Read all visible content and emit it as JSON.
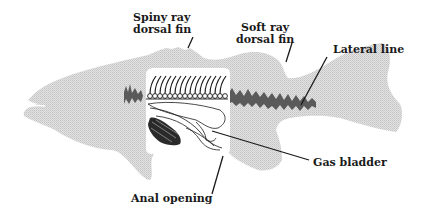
{
  "diagram": {
    "colors": {
      "body_fill": "#d4d4d4",
      "lateral_line": "#555555",
      "cutaway_bg": "#ffffff",
      "line": "#1a1a1a",
      "label_text": "#1a1a1a"
    },
    "labels": {
      "spiny_ray_dorsal_fin": {
        "line1": "Spiny ray",
        "line2": "dorsal fin"
      },
      "soft_ray_dorsal_fin": {
        "line1": "Soft ray",
        "line2": "dorsal fin"
      },
      "lateral_line": {
        "text": "Lateral line"
      },
      "gas_bladder": {
        "text": "Gas bladder"
      },
      "anal_opening": {
        "text": "Anal opening"
      }
    }
  }
}
